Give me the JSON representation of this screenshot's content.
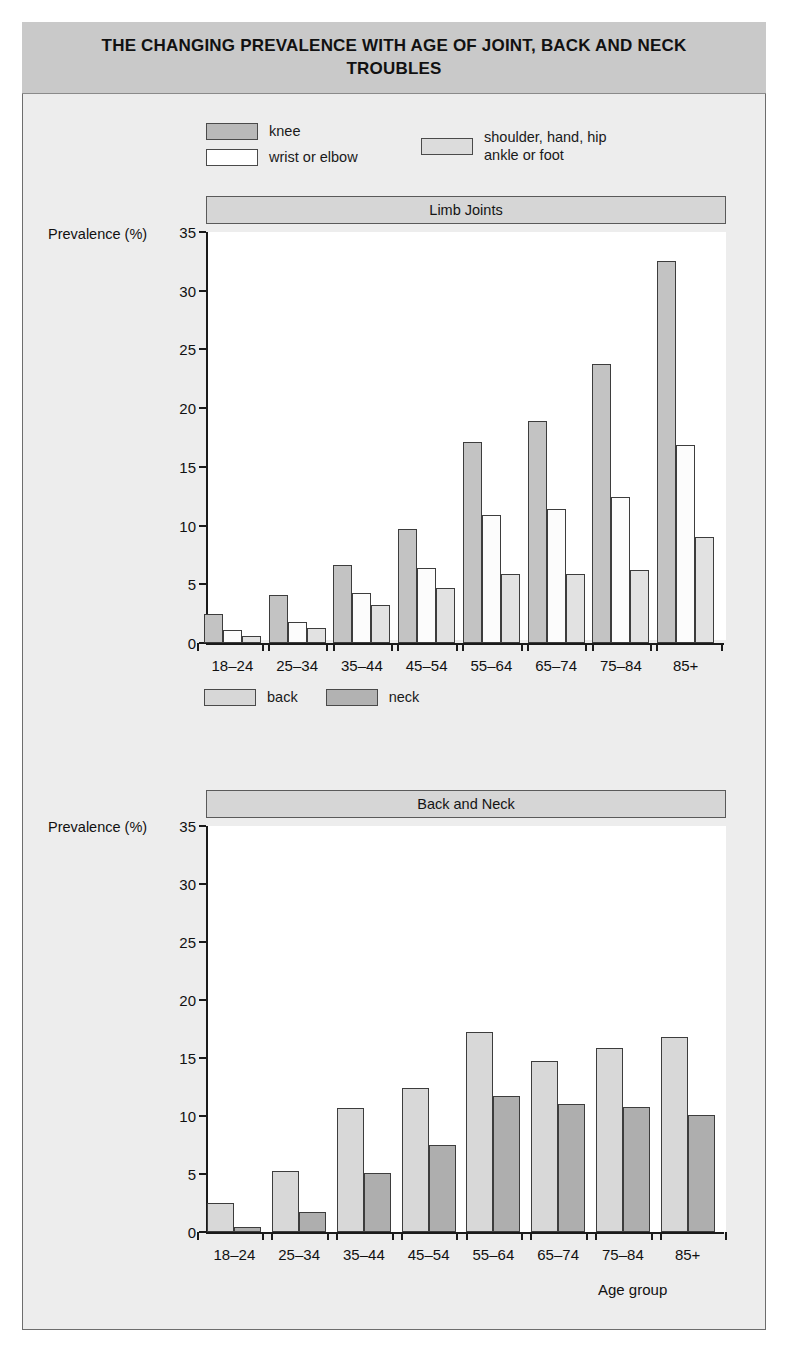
{
  "figure": {
    "title": "THE CHANGING PREVALENCE WITH AGE OF JOINT,\nBACK AND NECK TROUBLES",
    "axis_caption": "Age group",
    "y_axis_label": "Prevalence (%)"
  },
  "legend_top": {
    "knee": "knee",
    "wrist": "wrist or elbow",
    "shoulder": "shoulder, hand, hip\nankle or foot"
  },
  "legend_bottom": {
    "back": "back",
    "neck": "neck"
  },
  "colors": {
    "knee": "#c3c3c3",
    "wrist": "#fcfcfc",
    "shoulder": "#e2e2e2",
    "back": "#d8d8d8",
    "neck": "#aeaeae",
    "banner": "#c9c9c9",
    "panel_header": "#d6d6d6",
    "page_bg": "#ededed",
    "axis": "#1a1a1a"
  },
  "chart_data": [
    {
      "type": "bar",
      "title": "Limb Joints",
      "xlabel": "",
      "ylabel": "Prevalence (%)",
      "ylim": [
        0,
        35
      ],
      "yticks": [
        0,
        5,
        10,
        15,
        20,
        25,
        30,
        35
      ],
      "grid": false,
      "legend_position": "above-figure",
      "categories": [
        "18–24",
        "25–34",
        "35–44",
        "45–54",
        "55–64",
        "65–74",
        "75–84",
        "85+"
      ],
      "series": [
        {
          "name": "knee",
          "values": [
            2.5,
            4.1,
            6.6,
            9.7,
            17.1,
            18.9,
            23.8,
            32.5
          ]
        },
        {
          "name": "wrist or elbow",
          "values": [
            1.1,
            1.8,
            4.3,
            6.4,
            10.9,
            11.4,
            12.4,
            16.9
          ]
        },
        {
          "name": "shoulder, hand, hip ankle or foot",
          "values": [
            0.6,
            1.3,
            3.2,
            4.7,
            5.9,
            5.9,
            6.2,
            9.0
          ]
        }
      ]
    },
    {
      "type": "bar",
      "title": "Back and Neck",
      "xlabel": "Age group",
      "ylabel": "Prevalence (%)",
      "ylim": [
        0,
        35
      ],
      "yticks": [
        0,
        5,
        10,
        15,
        20,
        25,
        30,
        35
      ],
      "grid": false,
      "legend_position": "above-figure",
      "categories": [
        "18–24",
        "25–34",
        "35–44",
        "45–54",
        "55–64",
        "65–74",
        "75–84",
        "85+"
      ],
      "series": [
        {
          "name": "back",
          "values": [
            2.5,
            5.3,
            10.7,
            12.4,
            17.2,
            14.7,
            15.9,
            16.8
          ]
        },
        {
          "name": "neck",
          "values": [
            0.4,
            1.7,
            5.1,
            7.5,
            11.7,
            11.0,
            10.8,
            10.1
          ]
        }
      ]
    }
  ]
}
